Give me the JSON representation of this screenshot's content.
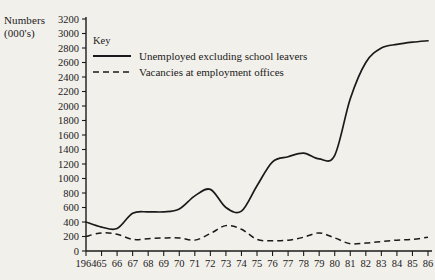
{
  "chart_data": {
    "type": "line",
    "title": "",
    "ylabel_lines": [
      "Numbers",
      "(000's)"
    ],
    "xlabel": "",
    "ylim": [
      0,
      3200
    ],
    "ytick_step": 200,
    "yticks": [
      0,
      200,
      400,
      600,
      800,
      1000,
      1200,
      1400,
      1600,
      1800,
      2000,
      2200,
      2400,
      2600,
      2800,
      3000,
      3200
    ],
    "ytick_labels": [
      "0",
      "200",
      "400",
      "600",
      "800",
      "1000",
      "1200",
      "1400",
      "1600",
      "1800",
      "2000",
      "2200",
      "2400",
      "2600",
      "2800",
      "3000",
      "3200"
    ],
    "x": [
      1964,
      1965,
      1966,
      1967,
      1968,
      1969,
      1970,
      1971,
      1972,
      1973,
      1974,
      1975,
      1976,
      1977,
      1978,
      1979,
      1980,
      1981,
      1982,
      1983,
      1984,
      1985,
      1986
    ],
    "xtick_labels": [
      "1964",
      "65",
      "66",
      "67",
      "68",
      "69",
      "70",
      "71",
      "72",
      "73",
      "74",
      "75",
      "76",
      "77",
      "78",
      "79",
      "80",
      "81",
      "82",
      "83",
      "84",
      "85",
      "86"
    ],
    "grid": false,
    "legend_position": "upper-left-inside",
    "legend_title": "Key",
    "series": [
      {
        "name": "Unemployed excluding school leavers",
        "style": "solid",
        "color": "#1a1a1a",
        "values": [
          400,
          330,
          310,
          520,
          540,
          540,
          580,
          760,
          850,
          600,
          550,
          900,
          1230,
          1300,
          1350,
          1270,
          1320,
          2100,
          2600,
          2800,
          2850,
          2880,
          2900
        ]
      },
      {
        "name": "Vacancies at employment offices",
        "style": "dashed",
        "color": "#1a1a1a",
        "values": [
          200,
          250,
          230,
          160,
          170,
          180,
          180,
          150,
          240,
          350,
          300,
          160,
          140,
          150,
          190,
          250,
          180,
          100,
          110,
          130,
          150,
          160,
          190
        ]
      }
    ]
  },
  "legend": {
    "title": "Key",
    "entries": [
      {
        "label": "Unemployed excluding school leavers",
        "style": "solid"
      },
      {
        "label": "Vacancies at employment offices",
        "style": "dashed"
      }
    ]
  }
}
